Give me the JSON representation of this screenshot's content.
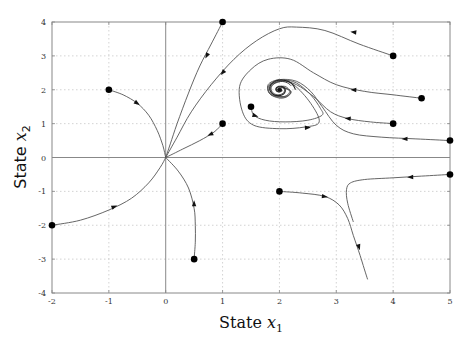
{
  "chart_data": {
    "type": "line",
    "title": "",
    "subtitle": "",
    "xlabel": "State x1",
    "ylabel": "State x2",
    "xlabel_parts": {
      "prefix": "State ",
      "var": "x",
      "sub": "1"
    },
    "ylabel_parts": {
      "prefix": "State ",
      "var": "x",
      "sub": "2"
    },
    "xlim": [
      -2,
      5
    ],
    "ylim": [
      -4,
      4
    ],
    "xticks": [
      -2,
      -1,
      0,
      1,
      2,
      3,
      4,
      5
    ],
    "yticks": [
      -4,
      -3,
      -2,
      -1,
      0,
      1,
      2,
      3,
      4
    ],
    "grid": true,
    "grid_style": "dotted",
    "legend": null,
    "equilibria": [
      {
        "name": "node",
        "x": 0,
        "y": 0
      },
      {
        "name": "focus",
        "x": 2,
        "y": 2
      }
    ],
    "initial_points": [
      [
        -1,
        2
      ],
      [
        -2,
        -2
      ],
      [
        0.5,
        -3
      ],
      [
        1,
        4
      ],
      [
        4,
        3
      ],
      [
        1,
        1
      ],
      [
        4.5,
        1.75
      ],
      [
        4,
        1
      ],
      [
        5,
        0.5
      ],
      [
        1.5,
        1.5
      ],
      [
        2,
        -1
      ],
      [
        5,
        -0.5
      ]
    ],
    "series": [
      {
        "name": "traj-from-(-1,2)",
        "points": [
          [
            -1,
            2
          ],
          [
            -0.75,
            1.85
          ],
          [
            -0.5,
            1.6
          ],
          [
            -0.3,
            1.25
          ],
          [
            -0.15,
            0.8
          ],
          [
            -0.05,
            0.35
          ],
          [
            0,
            0
          ]
        ],
        "arrows": [
          [
            -0.5,
            1.6,
            0.4,
            -0.45
          ]
        ]
      },
      {
        "name": "traj-from-(-2,-2)",
        "points": [
          [
            -2,
            -2
          ],
          [
            -1.5,
            -1.85
          ],
          [
            -1,
            -1.55
          ],
          [
            -0.6,
            -1.2
          ],
          [
            -0.3,
            -0.75
          ],
          [
            -0.1,
            -0.3
          ],
          [
            0,
            0
          ]
        ],
        "arrows": [
          [
            -0.9,
            -1.45,
            0.45,
            0.3
          ]
        ]
      },
      {
        "name": "traj-from-(0.5,-3)",
        "points": [
          [
            0.5,
            -3
          ],
          [
            0.52,
            -2.5
          ],
          [
            0.52,
            -2
          ],
          [
            0.5,
            -1.5
          ],
          [
            0.4,
            -0.9
          ],
          [
            0.22,
            -0.4
          ],
          [
            0,
            0
          ]
        ],
        "arrows": [
          [
            0.5,
            -1.35,
            0,
            0.5
          ]
        ]
      },
      {
        "name": "traj-from-(1,4)",
        "points": [
          [
            1,
            4
          ],
          [
            0.8,
            3.35
          ],
          [
            0.6,
            2.7
          ],
          [
            0.4,
            1.9
          ],
          [
            0.2,
            1.0
          ],
          [
            0.08,
            0.4
          ],
          [
            0,
            0
          ]
        ],
        "arrows": [
          [
            0.72,
            3.0,
            -0.12,
            -0.4
          ]
        ]
      },
      {
        "name": "traj-from-(4,3)",
        "points": [
          [
            4,
            3
          ],
          [
            3.4,
            3.35
          ],
          [
            2.8,
            3.75
          ],
          [
            2.3,
            3.85
          ],
          [
            2.0,
            3.8
          ],
          [
            1.6,
            3.45
          ],
          [
            1.2,
            2.9
          ],
          [
            0.8,
            2.15
          ],
          [
            0.45,
            1.35
          ],
          [
            0.2,
            0.6
          ],
          [
            0,
            0
          ]
        ],
        "arrows": [
          [
            3.3,
            3.7,
            -0.4,
            0.08
          ],
          [
            1.0,
            2.5,
            -0.2,
            -0.4
          ]
        ]
      },
      {
        "name": "traj-from-(1,1)",
        "points": [
          [
            1,
            1
          ],
          [
            0.85,
            0.75
          ],
          [
            0.6,
            0.5
          ],
          [
            0.3,
            0.25
          ],
          [
            0,
            0
          ]
        ],
        "arrows": [
          [
            0.78,
            0.68,
            -0.35,
            -0.25
          ]
        ]
      },
      {
        "name": "traj-from-(4.5,1.75)",
        "points": [
          [
            4.5,
            1.75
          ],
          [
            4,
            1.85
          ],
          [
            3.5,
            1.95
          ],
          [
            3.0,
            2.15
          ],
          [
            2.6,
            2.5
          ],
          [
            2.2,
            2.9
          ],
          [
            1.8,
            2.9
          ],
          [
            1.5,
            2.6
          ],
          [
            1.3,
            2.1
          ],
          [
            1.35,
            1.35
          ],
          [
            1.55,
            0.95
          ],
          [
            2.0,
            0.85
          ],
          [
            2.45,
            0.9
          ],
          [
            2.7,
            1.05
          ],
          [
            2.55,
            1.6
          ],
          [
            2.25,
            2.15
          ],
          [
            2.0,
            2.3
          ],
          [
            1.8,
            2.1
          ],
          [
            1.85,
            1.85
          ],
          [
            2.05,
            1.75
          ],
          [
            2.2,
            1.9
          ],
          [
            2.1,
            2.1
          ],
          [
            1.95,
            2.05
          ],
          [
            1.97,
            1.95
          ],
          [
            2.05,
            1.97
          ],
          [
            2,
            2
          ]
        ],
        "arrows": [
          [
            3.3,
            2.0,
            -0.4,
            0.03
          ]
        ]
      },
      {
        "name": "traj-from-(4,1)",
        "points": [
          [
            4,
            1
          ],
          [
            3.6,
            1.05
          ],
          [
            3.2,
            1.15
          ],
          [
            2.9,
            1.35
          ],
          [
            2.6,
            1.8
          ],
          [
            2.3,
            2.15
          ],
          [
            2.05,
            2.25
          ],
          [
            1.85,
            2.1
          ],
          [
            1.9,
            1.85
          ],
          [
            2.1,
            1.8
          ],
          [
            2.2,
            1.95
          ],
          [
            2.05,
            2.08
          ],
          [
            1.95,
            2.0
          ],
          [
            2,
            2
          ]
        ],
        "arrows": [
          [
            3.2,
            1.15,
            -0.4,
            0.05
          ]
        ]
      },
      {
        "name": "traj-from-(5,0.5)",
        "points": [
          [
            5,
            0.5
          ],
          [
            4.4,
            0.55
          ],
          [
            3.8,
            0.6
          ],
          [
            3.3,
            0.7
          ],
          [
            3.0,
            0.95
          ],
          [
            2.75,
            1.5
          ],
          [
            2.55,
            1.95
          ],
          [
            2.3,
            2.25
          ],
          [
            2.0,
            2.3
          ],
          [
            1.8,
            2.15
          ],
          [
            1.85,
            1.85
          ],
          [
            2.1,
            1.78
          ],
          [
            2.2,
            1.95
          ],
          [
            2.05,
            2.07
          ],
          [
            1.96,
            2.0
          ],
          [
            2,
            2
          ]
        ],
        "arrows": [
          [
            4.2,
            0.55,
            -0.4,
            0
          ]
        ]
      },
      {
        "name": "traj-from-(1.5,1.5)",
        "points": [
          [
            1.5,
            1.5
          ],
          [
            1.55,
            1.25
          ],
          [
            1.75,
            1.1
          ],
          [
            2.1,
            1.05
          ],
          [
            2.5,
            1.1
          ],
          [
            2.75,
            1.25
          ],
          [
            2.72,
            1.45
          ],
          [
            2.55,
            1.85
          ],
          [
            2.3,
            2.2
          ],
          [
            2.05,
            2.28
          ],
          [
            1.82,
            2.12
          ],
          [
            1.85,
            1.87
          ],
          [
            2.08,
            1.8
          ],
          [
            2.18,
            1.96
          ],
          [
            2.04,
            2.06
          ],
          [
            2,
            2
          ]
        ],
        "arrows": [
          [
            1.58,
            1.23,
            0.25,
            -0.12
          ],
          [
            2.5,
            0.88,
            0.35,
            0.02
          ]
        ]
      },
      {
        "name": "traj-from-(2,-1)",
        "points": [
          [
            2,
            -1
          ],
          [
            2.4,
            -1.05
          ],
          [
            2.8,
            -1.15
          ],
          [
            3.05,
            -1.4
          ],
          [
            3.2,
            -1.8
          ],
          [
            3.3,
            -2.3
          ],
          [
            3.42,
            -2.9
          ],
          [
            3.55,
            -3.6
          ]
        ],
        "arrows": [
          [
            2.8,
            -1.15,
            0.35,
            -0.08
          ],
          [
            3.4,
            -2.65,
            0.08,
            -0.45
          ]
        ]
      },
      {
        "name": "traj-from-(5,-0.5)",
        "points": [
          [
            5,
            -0.5
          ],
          [
            4.5,
            -0.55
          ],
          [
            4.0,
            -0.6
          ],
          [
            3.5,
            -0.65
          ],
          [
            3.25,
            -0.75
          ],
          [
            3.18,
            -0.95
          ],
          [
            3.2,
            -1.35
          ],
          [
            3.3,
            -1.9
          ]
        ],
        "arrows": [
          [
            4.3,
            -0.58,
            -0.4,
            -0.02
          ]
        ]
      }
    ]
  },
  "colors": {
    "curve": "#555555",
    "marker": "#000000",
    "axis": "#888888",
    "grid": "#c8c8c8",
    "zero_line": "#888888"
  }
}
